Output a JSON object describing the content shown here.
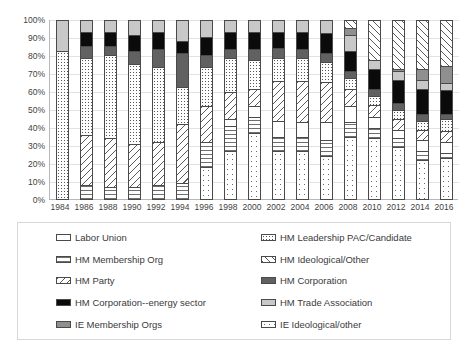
{
  "chart_data": {
    "type": "bar",
    "stacked": true,
    "stack_mode": "percent",
    "title": "",
    "xlabel": "",
    "ylabel": "",
    "ylim": [
      0,
      100
    ],
    "grid": true,
    "legend_position": "bottom",
    "y_ticks": [
      "100%",
      "90%",
      "80%",
      "70%",
      "60%",
      "50%",
      "40%",
      "30%",
      "20%",
      "10%",
      "0%"
    ],
    "categories": [
      "1984",
      "1986",
      "1988",
      "1990",
      "1992",
      "1994",
      "1996",
      "1998",
      "2000",
      "2002",
      "2004",
      "2006",
      "2008",
      "2010",
      "2012",
      "2014",
      "2016"
    ],
    "series": [
      {
        "name": "Labor Union",
        "key": "labor",
        "pattern": "solid-white",
        "values": [
          0,
          0,
          0,
          0,
          0,
          0,
          0,
          4,
          6,
          9,
          8,
          10,
          9,
          6,
          5,
          6,
          6
        ]
      },
      {
        "name": "HM Membership Org",
        "key": "hm_membership_org",
        "pattern": "horizontal-lines",
        "values": [
          0,
          8,
          7,
          7,
          8,
          9,
          14,
          14,
          9,
          8,
          8,
          9,
          8,
          6,
          5,
          5,
          3
        ]
      },
      {
        "name": "HM Party",
        "key": "hm_party",
        "pattern": "diagonal-hatch-up",
        "values": [
          0,
          28,
          27,
          24,
          24,
          33,
          20,
          15,
          10,
          22,
          23,
          23,
          10,
          7,
          6,
          6,
          6
        ]
      },
      {
        "name": "HM Corporation--energy sector",
        "key": "hm_corp_energy",
        "pattern": "solid-black",
        "values": [
          0,
          8,
          8,
          9,
          10,
          7,
          10,
          10,
          10,
          9,
          10,
          11,
          11,
          11,
          13,
          14,
          13
        ]
      },
      {
        "name": "IE Membership Orgs",
        "key": "ie_membership_orgs",
        "pattern": "solid-medium-gray",
        "values": [
          0,
          0,
          0,
          0,
          0,
          0,
          0,
          0,
          0,
          0,
          0,
          0,
          4,
          0,
          1,
          6,
          10
        ]
      },
      {
        "name": "HM Leadership PAC/Candidate",
        "key": "hm_leadership_pac",
        "pattern": "fine-dots",
        "values": [
          83,
          43,
          47,
          45,
          42,
          21,
          22,
          19,
          16,
          13,
          13,
          11,
          6,
          5,
          5,
          5,
          7
        ]
      },
      {
        "name": "HM Ideological/Other",
        "key": "hm_ideological_other",
        "pattern": "diagonal-hatch-down",
        "values": [
          0,
          0,
          0,
          0,
          0,
          0,
          0,
          0,
          0,
          0,
          0,
          0,
          4,
          22,
          27,
          27,
          25
        ]
      },
      {
        "name": "HM Corporation",
        "key": "hm_corporation",
        "pattern": "solid-dark-gray",
        "values": [
          0,
          7,
          5,
          7,
          10,
          19,
          7,
          5,
          6,
          6,
          5,
          5,
          4,
          4,
          4,
          4,
          3
        ]
      },
      {
        "name": "HM Trade Association",
        "key": "hm_trade_association",
        "pattern": "solid-light-gray",
        "values": [
          17,
          6,
          6,
          8,
          6,
          11,
          9,
          6,
          6,
          6,
          6,
          7,
          9,
          5,
          5,
          5,
          4
        ]
      },
      {
        "name": "IE Ideological/other",
        "key": "ie_ideological_other",
        "pattern": "sparse-dots",
        "values": [
          0,
          0,
          0,
          0,
          0,
          0,
          18,
          27,
          37,
          27,
          27,
          24,
          35,
          34,
          29,
          22,
          23
        ]
      }
    ],
    "stack_order_bottom_to_top": [
      "ie_ideological_other",
      "hm_membership_org",
      "labor",
      "hm_party",
      "hm_leadership_pac",
      "hm_corporation",
      "hm_corp_energy",
      "hm_trade_association",
      "ie_membership_orgs",
      "hm_ideological_other"
    ]
  },
  "legend": {
    "items": [
      {
        "label": "Labor Union",
        "swatch": "solid-white"
      },
      {
        "label": "HM Leadership PAC/Candidate",
        "swatch": "fine-dots"
      },
      {
        "label": "HM Membership Org",
        "swatch": "horizontal-lines"
      },
      {
        "label": "HM Ideological/Other",
        "swatch": "diagonal-hatch-down"
      },
      {
        "label": "HM Party",
        "swatch": "diagonal-hatch-up"
      },
      {
        "label": "HM Corporation",
        "swatch": "solid-dark-gray"
      },
      {
        "label": "HM Corporation--energy sector",
        "swatch": "solid-black"
      },
      {
        "label": "HM Trade Association",
        "swatch": "solid-light-gray"
      },
      {
        "label": "IE Membership Orgs",
        "swatch": "solid-medium-gray"
      },
      {
        "label": "IE Ideological/other",
        "swatch": "sparse-dots"
      }
    ]
  },
  "colors": {
    "solid_white": "#ffffff",
    "solid_light_gray": "#c8c8c8",
    "solid_medium_gray": "#8f8f8f",
    "solid_dark_gray": "#616161",
    "solid_black": "#0b0b0b",
    "outline": "#4a4a4a",
    "gridline": "#e2e2e2",
    "text": "#3a3a3a"
  }
}
